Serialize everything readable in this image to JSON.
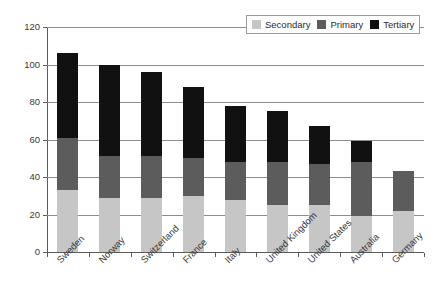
{
  "chart_data": {
    "type": "bar",
    "subtype": "stacked-bar",
    "title": "",
    "xlabel": "",
    "ylabel": "",
    "ylim": [
      0,
      120
    ],
    "ytick_step": 20,
    "yticks": [
      0,
      20,
      40,
      60,
      80,
      100,
      120
    ],
    "ytick_labels": [
      "0",
      "20",
      "40",
      "60",
      "80",
      "100",
      "120"
    ],
    "grid": true,
    "grid_axis": "y",
    "legend_position": "top-right",
    "legend": [
      "Secondary",
      "Primary",
      "Tertiary"
    ],
    "categories": [
      "Sweden",
      "Norway",
      "Switzerland",
      "France",
      "Italy",
      "United Kingdom",
      "United States",
      "Australia",
      "Germany"
    ],
    "series": [
      {
        "name": "Secondary",
        "color": "#c6c6c6",
        "values": [
          33,
          29,
          29,
          30,
          28,
          25,
          25,
          19,
          22
        ]
      },
      {
        "name": "Primary",
        "color": "#5c5c5c",
        "values": [
          28,
          22,
          22,
          20,
          20,
          23,
          22,
          29,
          21
        ]
      },
      {
        "name": "Tertiary",
        "color": "#111111",
        "values": [
          45,
          49,
          45,
          38,
          30,
          27,
          20,
          11,
          0
        ]
      }
    ],
    "totals": [
      106,
      100,
      96,
      88,
      78,
      75,
      67,
      59,
      43
    ]
  },
  "colors": {
    "secondary": "#c6c6c6",
    "primary": "#5c5c5c",
    "tertiary": "#111111",
    "grid": "#8c8c8c",
    "axis": "#5a5a5a",
    "text": "#3a3a3a",
    "background": "#ffffff"
  }
}
